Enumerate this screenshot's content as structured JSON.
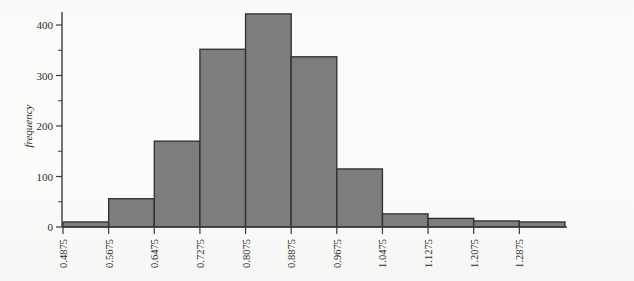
{
  "chart_data": {
    "type": "bar",
    "title": "",
    "subtitle": "",
    "xlabel": "",
    "ylabel": "frequency",
    "grid": false,
    "legend": null,
    "bin_width": 0.08,
    "bin_edges": [
      0.4875,
      0.5675,
      0.6475,
      0.7275,
      0.8075,
      0.8875,
      0.9675,
      1.0475,
      1.1275,
      1.2075,
      1.2875,
      1.3675
    ],
    "categories": [
      "0.4875",
      "0.5675",
      "0.6475",
      "0.7275",
      "0.8075",
      "0.8875",
      "0.9675",
      "1.0475",
      "1.1275",
      "1.2075",
      "1.2875"
    ],
    "values": [
      10,
      56,
      170,
      352,
      422,
      337,
      115,
      26,
      17,
      12,
      10
    ],
    "xlim": [
      0.4875,
      1.3675
    ],
    "ylim": [
      0,
      440
    ],
    "xticks": [
      "0.4875",
      "0.5675",
      "0.6475",
      "0.7275",
      "0.8075",
      "0.8875",
      "0.9675",
      "1.0475",
      "1.1275",
      "1.2075",
      "1.2875"
    ],
    "yticks": [
      "0",
      "100",
      "200",
      "300",
      "400"
    ],
    "yticks_minor": [
      "50",
      "150",
      "250",
      "350"
    ],
    "bar_fill_color": "#7d7d7d",
    "bar_edge_color": "#2e2e2e",
    "axis_color": "#3a3a3a",
    "background_color": "#fdfdfc"
  }
}
